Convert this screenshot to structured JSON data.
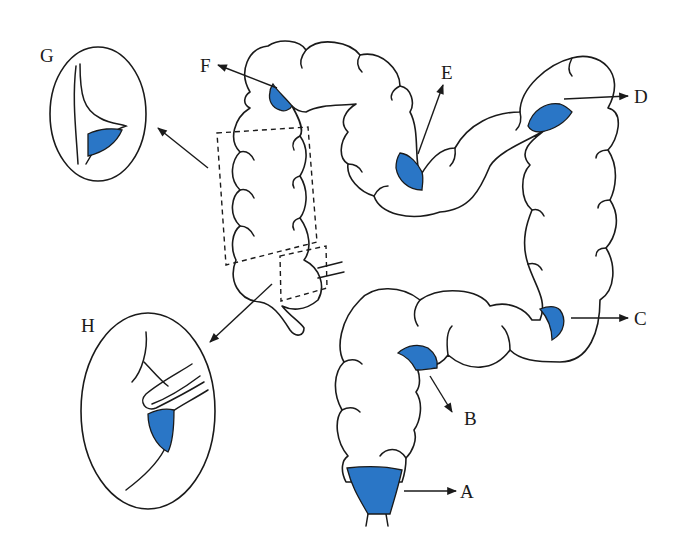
{
  "diagram": {
    "lesion_color": "#2a76c6",
    "outline_color": "#1a1a1a",
    "labels": {
      "A": "A",
      "B": "B",
      "C": "C",
      "D": "D",
      "E": "E",
      "F": "F",
      "G": "G",
      "H": "H"
    },
    "callouts": [
      {
        "id": "G",
        "description": "magnified inset of ascending-colon region (dashed box)"
      },
      {
        "id": "H",
        "description": "magnified inset of cecum / ileocecal region (dashed box)"
      }
    ]
  }
}
